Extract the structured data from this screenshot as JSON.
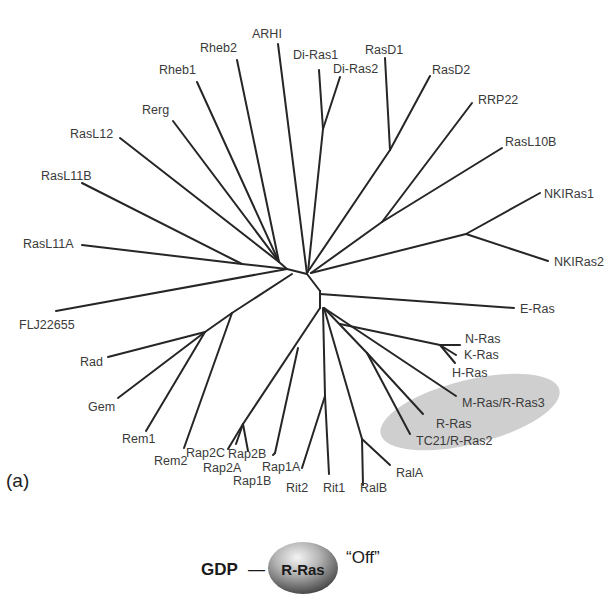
{
  "figure": {
    "panel_label": "(a)",
    "highlight": {
      "members": [
        "M-Ras/R-Ras3",
        "R-Ras",
        "TC21/R-Ras2"
      ],
      "color": "#cfcfcf"
    }
  },
  "leaves": {
    "arhi": "ARHI",
    "rheb2": "Rheb2",
    "rheb1": "Rheb1",
    "rerg": "Rerg",
    "rasl12": "RasL12",
    "rasl11b": "RasL11B",
    "rasl11a": "RasL11A",
    "flj22655": "FLJ22655",
    "rad": "Rad",
    "gem": "Gem",
    "rem1": "Rem1",
    "rem2": "Rem2",
    "rap2c": "Rap2C",
    "rap2a": "Rap2A",
    "rap2b": "Rap2B",
    "rap1b": "Rap1B",
    "rap1a": "Rap1A",
    "rit2": "Rit2",
    "rit1": "Rit1",
    "ralb": "RalB",
    "rala": "RalA",
    "tc21": "TC21/R-Ras2",
    "rras": "R-Ras",
    "mras": "M-Ras/R-Ras3",
    "hras": "H-Ras",
    "kras": "K-Ras",
    "nras": "N-Ras",
    "eras": "E-Ras",
    "nkiras2": "NKIRas2",
    "nkiras1": "NKIRas1",
    "rasl10b": "RasL10B",
    "rrp22": "RRP22",
    "rasd2": "RasD2",
    "rasd1": "RasD1",
    "diras2": "Di-Ras2",
    "diras1": "Di-Ras1"
  },
  "state_diagram": {
    "nucleotide": "GDP",
    "connector": "—",
    "protein": "R-Ras",
    "state": "“Off”"
  }
}
